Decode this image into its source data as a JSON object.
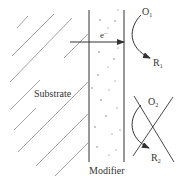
{
  "diagram": {
    "labels": {
      "substrate": "Substrate",
      "modifier": "Modifier",
      "electron": "e",
      "electron_charge": "−",
      "o1": "O",
      "o1_sub": "1",
      "r1": "R",
      "r1_sub": "1",
      "o2": "O",
      "o2_sub": "2",
      "r2": "R",
      "r2_sub": "2"
    },
    "colors": {
      "line": "#555555",
      "hatch": "#8a8a8a",
      "text": "#333333",
      "background": "#ffffff"
    },
    "regions": {
      "substrate": "hatched electrode region",
      "modifier": "dotted modifier layer between two vertical lines"
    },
    "reactions": [
      {
        "from": "O1",
        "to": "R1",
        "blocked": false
      },
      {
        "from": "O2",
        "to": "R2",
        "blocked": true
      }
    ]
  }
}
